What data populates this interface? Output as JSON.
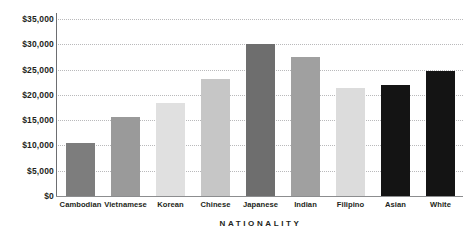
{
  "chart_data": {
    "type": "bar",
    "title": "",
    "subtitle": "",
    "xlabel": "NATIONALITY",
    "ylabel": "",
    "categories": [
      "Cambodian",
      "Vietnamese",
      "Korean",
      "Chinese",
      "Japanese",
      "Indian",
      "Filipino",
      "Asian",
      "White"
    ],
    "values": [
      10500,
      15700,
      18400,
      23200,
      30000,
      27400,
      21400,
      22000,
      24800
    ],
    "bar_colors": [
      "#7d7d7d",
      "#9a9a9a",
      "#e0e0e0",
      "#c6c6c6",
      "#6e6e6e",
      "#a0a0a0",
      "#dcdcdc",
      "#141414",
      "#141414"
    ],
    "ylim": [
      0,
      35000
    ],
    "y_ticks": [
      0,
      5000,
      10000,
      15000,
      20000,
      25000,
      30000,
      35000
    ],
    "y_tick_labels": [
      "$0",
      "$5,000",
      "$10,000",
      "$15,000",
      "$20,000",
      "$25,000",
      "$30,000",
      "$35,000"
    ],
    "grid": true,
    "grid_style": "dotted",
    "grid_color": "#b9b9bb",
    "legend": false,
    "legend_position": "none",
    "axis_color": "#6d6e71",
    "text_color": "#231f20",
    "background": "#ffffff"
  }
}
